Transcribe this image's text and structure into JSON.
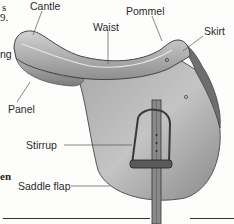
{
  "diagram": {
    "labels": {
      "cantle": "Cantle",
      "waist": "Waist",
      "pommel": "Pommel",
      "skirt": "Skirt",
      "panel": "Panel",
      "stirrup": "Stirrup",
      "saddle_flap": "Saddle flap"
    },
    "text_fragments": {
      "top_left_1": "s",
      "top_left_2": "9.",
      "mid_left": "ng",
      "lower_left_bold": "en"
    },
    "colors": {
      "leather_light": "#bdbdbd",
      "leather_mid": "#9a9a9a",
      "leather_dark": "#5a5a5a",
      "leader_line": "#555555",
      "text": "#2a2a2a"
    }
  }
}
